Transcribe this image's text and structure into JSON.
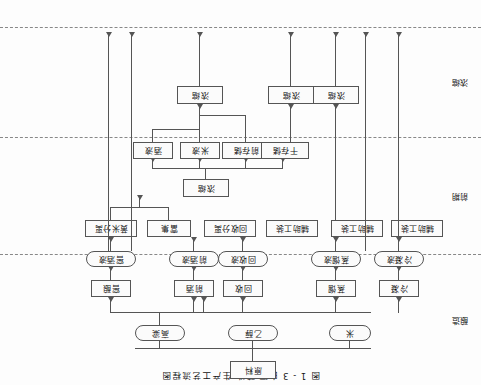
{
  "figure": {
    "title": "图 1 - 3  白酒  酿造  生产工艺流程图",
    "type": "flowchart",
    "orientation_note": "rendered-180-rotated"
  },
  "lanes": [
    {
      "id": "lane-top",
      "label": "浓缩"
    },
    {
      "id": "lane-middle",
      "label": "前期"
    },
    {
      "id": "lane-bottom",
      "label": "酿造"
    }
  ],
  "nodes": {
    "top_row": [
      {
        "id": "n-concentrate-1",
        "label": "浓缩"
      },
      {
        "id": "n-concentrate-2",
        "label": "浓缩"
      },
      {
        "id": "n-concentrate-3",
        "label": "浓缩"
      }
    ],
    "mid_row": [
      {
        "id": "n-wet-store",
        "label": "干存储"
      },
      {
        "id": "n-front-store",
        "label": "前存储"
      },
      {
        "id": "n-rice-liquid",
        "label": "米液"
      },
      {
        "id": "n-wine-liquid",
        "label": "酒液"
      }
    ],
    "mid_single": {
      "id": "n-concentrate-4",
      "label": "浓缩"
    },
    "tool_row": [
      {
        "id": "n-aux-tool-1",
        "label": "辅助工装"
      },
      {
        "id": "n-aux-tool-2",
        "label": "辅助工装"
      },
      {
        "id": "n-aux-tool-3",
        "label": "辅助工装"
      },
      {
        "id": "n-recover-sep",
        "label": "回收分离"
      },
      {
        "id": "n-enrich",
        "label": "富集"
      },
      {
        "id": "n-rice-sep",
        "label": "黄米分离"
      }
    ],
    "pill_row": [
      {
        "id": "p-cooling-liquid",
        "label": "冷凝液"
      },
      {
        "id": "p-distill-liquid",
        "label": "蒸馏液"
      },
      {
        "id": "p-recover-liquid",
        "label": "回收液"
      },
      {
        "id": "p-front-liquid",
        "label": "前酒液"
      },
      {
        "id": "p-fermented",
        "label": "窖酒液"
      }
    ],
    "box_row": [
      {
        "id": "b-cooling",
        "label": "冷凝"
      },
      {
        "id": "b-distill",
        "label": "蒸馏"
      },
      {
        "id": "b-recover",
        "label": "回收"
      },
      {
        "id": "b-front",
        "label": "前酒"
      },
      {
        "id": "b-ferment",
        "label": "窖酿"
      }
    ],
    "material_row": [
      {
        "id": "m-sorghum",
        "label": "高粱"
      },
      {
        "id": "m-ethanol",
        "label": "乙醇"
      },
      {
        "id": "m-rice",
        "label": "米"
      }
    ],
    "source": {
      "id": "s-raw-material",
      "label": "原料"
    }
  },
  "colors": {
    "stroke": "#555555",
    "lane_divider": "#888888",
    "node_fill": "#fbfbfb",
    "text": "#111111",
    "background": "#fdfdfd"
  }
}
